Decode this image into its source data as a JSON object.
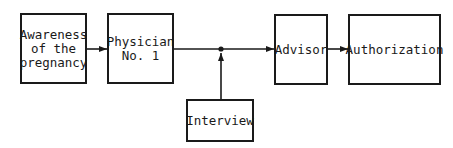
{
  "diagram": {
    "nodes": [
      {
        "id": "awareness",
        "label": "Awareness\nof the\npregnancy"
      },
      {
        "id": "physician",
        "label": "Physician\nNo. 1"
      },
      {
        "id": "advisor",
        "label": "Advisor"
      },
      {
        "id": "authorization",
        "label": "Authorization"
      },
      {
        "id": "interview",
        "label": "Interview"
      }
    ],
    "edges": [
      {
        "from": "awareness",
        "to": "physician"
      },
      {
        "from": "physician",
        "to": "advisor",
        "via": "junction"
      },
      {
        "from": "interview",
        "to": "junction"
      },
      {
        "from": "advisor",
        "to": "authorization"
      }
    ],
    "colors": {
      "stroke": "#1a1a1a",
      "background": "#ffffff"
    }
  }
}
